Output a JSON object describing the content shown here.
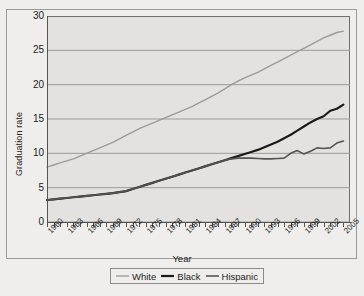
{
  "figure": {
    "top_caption": "",
    "xaxis_title": "Year",
    "yaxis_title": "Graduation rate"
  },
  "legend": {
    "items": [
      {
        "label": "White",
        "color": "#9b9b99",
        "width": 1.4
      },
      {
        "label": "Black",
        "color": "#1b1b1b",
        "width": 2.2
      },
      {
        "label": "Hispanic",
        "color": "#55544f",
        "width": 1.6
      }
    ]
  },
  "chart_data": {
    "type": "line",
    "title": "",
    "xlabel": "Year",
    "ylabel": "Graduation rate",
    "xlim": [
      1960,
      2006
    ],
    "ylim": [
      0,
      30
    ],
    "yticks": [
      0,
      5,
      10,
      15,
      20,
      25,
      30
    ],
    "xticks_labeled": [
      1960,
      1963,
      1966,
      1969,
      1972,
      1975,
      1978,
      1981,
      1984,
      1987,
      1990,
      1993,
      1996,
      1999,
      2002,
      2005
    ],
    "xtick_step_minor": 1,
    "grid": "horizontal",
    "legend_position": "bottom",
    "x": [
      1960,
      1961,
      1962,
      1963,
      1964,
      1965,
      1966,
      1967,
      1968,
      1969,
      1970,
      1971,
      1972,
      1973,
      1974,
      1975,
      1976,
      1977,
      1978,
      1979,
      1980,
      1981,
      1982,
      1983,
      1984,
      1985,
      1986,
      1987,
      1988,
      1989,
      1990,
      1991,
      1992,
      1993,
      1994,
      1995,
      1996,
      1997,
      1998,
      1999,
      2000,
      2001,
      2002,
      2003,
      2004,
      2005
    ],
    "series": [
      {
        "name": "White",
        "color": "#9b9b99",
        "values": [
          8.0,
          8.3,
          8.6,
          8.9,
          9.2,
          9.6,
          10.0,
          10.4,
          10.8,
          11.2,
          11.6,
          12.1,
          12.6,
          13.1,
          13.6,
          14.0,
          14.4,
          14.8,
          15.2,
          15.6,
          16.0,
          16.4,
          16.8,
          17.3,
          17.8,
          18.3,
          18.8,
          19.4,
          20.0,
          20.5,
          21.0,
          21.4,
          21.8,
          22.3,
          22.8,
          23.3,
          23.8,
          24.3,
          24.8,
          25.3,
          25.8,
          26.3,
          26.8,
          27.2,
          27.6,
          27.8
        ]
      },
      {
        "name": "Black",
        "color": "#1b1b1b",
        "values": [
          3.2,
          3.3,
          3.4,
          3.5,
          3.6,
          3.7,
          3.8,
          3.9,
          4.0,
          4.1,
          4.2,
          4.35,
          4.5,
          4.8,
          5.1,
          5.4,
          5.7,
          6.0,
          6.3,
          6.6,
          6.9,
          7.2,
          7.5,
          7.8,
          8.1,
          8.4,
          8.7,
          9.0,
          9.3,
          9.6,
          9.9,
          10.2,
          10.5,
          10.9,
          11.3,
          11.7,
          12.2,
          12.7,
          13.3,
          13.9,
          14.5,
          15.0,
          15.4,
          16.2,
          16.5,
          17.1
        ]
      },
      {
        "name": "Hispanic",
        "color": "#55544f",
        "values": [
          3.2,
          3.3,
          3.4,
          3.5,
          3.6,
          3.7,
          3.8,
          3.9,
          4.0,
          4.1,
          4.2,
          4.35,
          4.5,
          4.8,
          5.1,
          5.4,
          5.7,
          6.0,
          6.3,
          6.6,
          6.9,
          7.2,
          7.5,
          7.8,
          8.1,
          8.4,
          8.7,
          9.0,
          9.2,
          9.3,
          9.3,
          9.3,
          9.25,
          9.2,
          9.2,
          9.25,
          9.3,
          10.0,
          10.4,
          9.9,
          10.3,
          10.8,
          10.7,
          10.8,
          11.5,
          11.8
        ]
      }
    ]
  }
}
